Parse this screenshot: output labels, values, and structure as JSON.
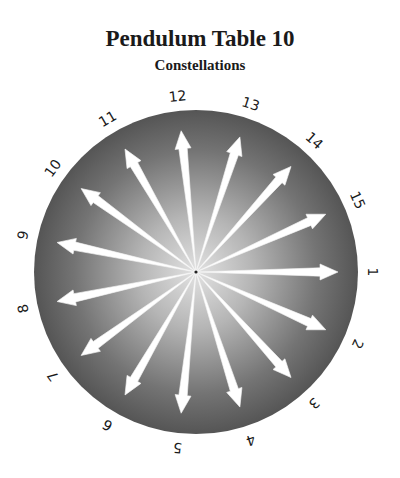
{
  "header": {
    "title": "Pendulum Table 10",
    "subtitle": "Constellations"
  },
  "dial": {
    "center": [
      196,
      272
    ],
    "radius": 162,
    "label_radius": 177,
    "arrow_length": 142,
    "start_angle_deg": 0,
    "step_deg": 24,
    "colors": {
      "edge": "#555555",
      "center": "#d8d8d8",
      "arrow": "#ffffff",
      "label": "#1a1a1a"
    },
    "labels": [
      "1",
      "2",
      "3",
      "4",
      "5",
      "6",
      "7",
      "8",
      "9",
      "10",
      "11",
      "12",
      "13",
      "14",
      "15"
    ]
  }
}
